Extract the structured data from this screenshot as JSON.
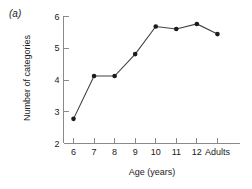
{
  "panel": {
    "label": "(a)"
  },
  "chart_data": {
    "type": "line",
    "title": "",
    "subtitle": "",
    "xlabel": "Age (years)",
    "ylabel": "Number of categories",
    "categories": [
      "6",
      "7",
      "8",
      "9",
      "10",
      "11",
      "12",
      "Adults"
    ],
    "values": [
      2.76,
      4.11,
      4.11,
      4.8,
      5.67,
      5.59,
      5.75,
      5.43
    ],
    "series": [
      {
        "name": "Number of categories",
        "values": [
          2.76,
          4.11,
          4.11,
          4.8,
          5.67,
          5.59,
          5.75,
          5.43
        ]
      }
    ],
    "ylim": [
      2,
      6
    ],
    "yticks": [
      2,
      3,
      4,
      5,
      6
    ],
    "ytick_labels": [
      "2",
      "3",
      "4",
      "5",
      "6"
    ],
    "xtick_labels": [
      "6",
      "7",
      "8",
      "9",
      "10",
      "11",
      "12",
      "Adults"
    ],
    "grid": false,
    "legend": false,
    "legend_position": "none",
    "marker": "filled-circle",
    "line_color": "#404040",
    "marker_color": "#1c1c1c",
    "axis_color": "#8a8a8a"
  }
}
